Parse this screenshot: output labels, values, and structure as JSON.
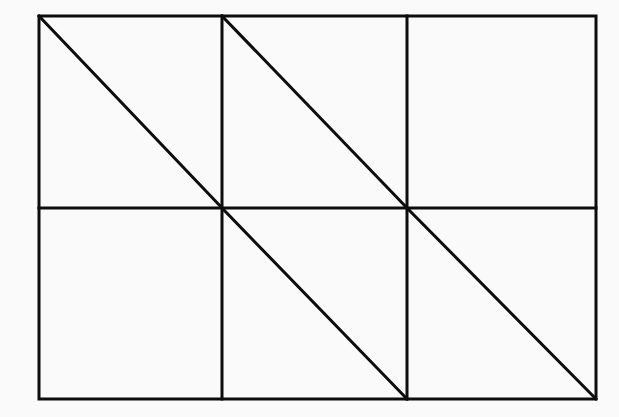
{
  "diagram": {
    "stroke_color": "#0d0d0d",
    "background": "#fafafa",
    "outer_rect": {
      "x1": 39,
      "y1": 16,
      "x2": 596,
      "y2": 399
    },
    "columns_x": [
      39,
      222,
      407,
      596
    ],
    "rows_y": [
      16,
      208,
      399
    ],
    "diagonals": [
      {
        "col": 0,
        "row": 0
      },
      {
        "col": 1,
        "row": 0
      },
      {
        "col": 1,
        "row": 1
      },
      {
        "col": 2,
        "row": 1
      }
    ]
  }
}
